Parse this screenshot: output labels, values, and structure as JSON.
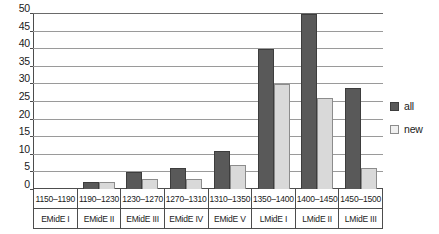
{
  "chart_data": {
    "type": "bar",
    "title": "",
    "subtitle": "",
    "xlabel": "",
    "ylabel": "",
    "ylim": [
      0,
      50
    ],
    "ytick_step": 5,
    "yticks": [
      50,
      45,
      40,
      35,
      30,
      25,
      20,
      15,
      10,
      5,
      0
    ],
    "grid": true,
    "legend_position": "right",
    "categories": [
      "1150–1190",
      "1190–1230",
      "1230–1270",
      "1270–1310",
      "1310–1350",
      "1350–1400",
      "1400–1450",
      "1450–1500"
    ],
    "category_periods": [
      "EMidE I",
      "EMidE II",
      "EMidE III",
      "EMidE IV",
      "EMidE V",
      "LMidE I",
      "LMidE II",
      "LMidE III"
    ],
    "series": [
      {
        "name": "all",
        "color": "#595959",
        "values": [
          0,
          2,
          5,
          6,
          11,
          40,
          50,
          29
        ]
      },
      {
        "name": "new",
        "color": "#d9d9d9",
        "values": [
          0,
          2,
          3,
          3,
          7,
          30,
          26,
          6
        ]
      }
    ]
  },
  "legend": {
    "items": [
      {
        "label": "all",
        "swatch": "dark-gray-swatch"
      },
      {
        "label": "new",
        "swatch": "light-gray-swatch"
      }
    ]
  },
  "colors": {
    "series_all": "#595959",
    "series_new": "#d9d9d9",
    "axis": "#4d4d4d",
    "gridline": "#9a9a9a",
    "background": "#ffffff",
    "text": "#1a1a1a"
  }
}
